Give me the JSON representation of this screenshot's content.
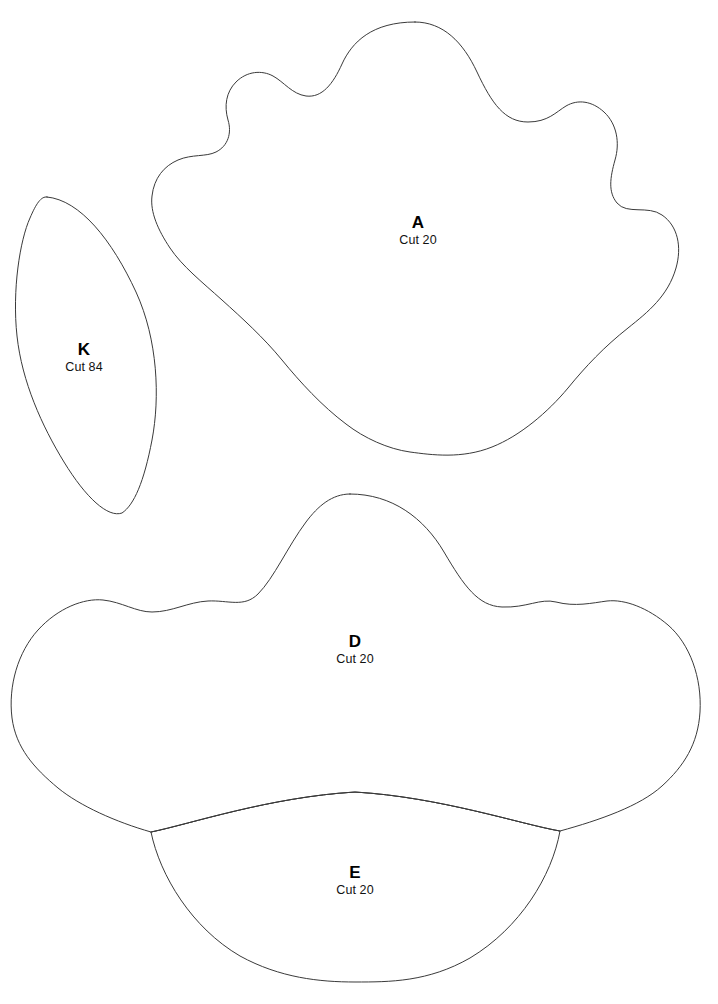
{
  "document": {
    "type": "sewing-pattern-template-sheet",
    "background_color": "#ffffff",
    "line_color": "#3a3a3a",
    "text_color": "#000000",
    "width": 718,
    "height": 1004
  },
  "pieces": [
    {
      "id": "A",
      "letter": "A",
      "cut_label": "Cut 20",
      "label_x": 418,
      "label_y": 213,
      "shape": "scalloped-blob-large",
      "path": "M 415 22 C 443 22 463 42 477 72 C 492 104 505 122 528 122 C 548 122 556 112 566 106 C 578 99 592 101 604 112 C 617 124 620 143 615 160 C 610 178 608 192 617 203 C 627 215 648 205 662 215 C 678 226 682 247 676 268 C 668 296 648 312 628 328 C 604 347 586 366 568 388 C 548 412 520 436 492 447 C 462 459 432 455 410 452 C 388 449 364 438 346 424 C 322 406 300 382 282 360 C 264 338 242 318 222 300 C 202 282 182 266 170 248 C 158 230 150 212 152 196 C 154 178 164 166 178 160 C 192 154 206 157 216 152 C 228 146 232 133 228 120 C 224 106 226 92 236 82 C 247 71 262 70 273 76 C 284 82 292 94 306 96 C 322 98 333 84 342 64 C 352 42 372 22 415 22 Z"
    },
    {
      "id": "K",
      "letter": "K",
      "cut_label": "Cut 84",
      "label_x": 84,
      "label_y": 340,
      "shape": "leaf-ellipse-tilted",
      "path": "M 47 197 C 80 200 112 240 136 292 C 158 340 160 398 152 440 C 144 482 134 505 122 513 C 108 518 86 498 64 462 C 42 426 22 382 17 336 C 12 290 20 240 30 218 C 36 204 41 196 47 197 Z"
    },
    {
      "id": "D",
      "letter": "D",
      "cut_label": "Cut 20",
      "label_x": 355,
      "label_y": 632,
      "shape": "scalloped-yoke-wide",
      "path": "M 350 494 C 392 494 424 518 444 552 C 464 586 478 606 502 607 C 527 608 540 598 556 602 C 575 607 592 603 607 601 C 625 599 648 608 668 625 C 690 644 702 678 700 712 C 698 744 684 766 662 786 C 640 806 600 820 560 831 C 520 824 440 797 355 792 C 270 797 190 824 151 832 C 116 822 80 806 58 788 C 34 768 16 748 12 718 C 8 686 18 652 38 630 C 58 608 84 598 103 600 C 122 602 136 612 152 612 C 172 612 188 602 208 601 C 228 600 244 608 258 594 C 274 578 288 546 306 522 C 318 506 332 494 350 494 Z"
    },
    {
      "id": "E",
      "letter": "E",
      "cut_label": "Cut 20",
      "label_x": 355,
      "label_y": 863,
      "shape": "lens-crescent",
      "path": "M 151 832 C 190 824 270 797 355 792 C 440 797 520 824 560 831 C 552 876 520 928 470 958 C 428 982 390 982 355 982 C 320 982 280 978 240 956 C 192 928 160 876 151 832 Z",
      "top_edge_path": "M 151 832 C 190 824 270 797 355 792 C 440 797 520 824 560 831"
    }
  ]
}
